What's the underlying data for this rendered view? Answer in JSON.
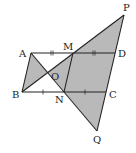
{
  "diagram": {
    "points": {
      "A": {
        "label": "A",
        "x": 31,
        "y": 53
      },
      "M": {
        "label": "M",
        "x": 73,
        "y": 53
      },
      "D": {
        "label": "D",
        "x": 115,
        "y": 53
      },
      "B": {
        "label": "B",
        "x": 22,
        "y": 92
      },
      "N": {
        "label": "N",
        "x": 64,
        "y": 92
      },
      "C": {
        "label": "C",
        "x": 106,
        "y": 92
      },
      "O": {
        "label": "O",
        "x": 48,
        "y": 72
      },
      "P": {
        "label": "P",
        "x": 124,
        "y": 15
      },
      "Q": {
        "label": "Q",
        "x": 97,
        "y": 131
      }
    },
    "labels": {
      "A": "A",
      "M": "M",
      "D": "D",
      "B": "B",
      "N": "N",
      "C": "C",
      "O": "O",
      "P": "P",
      "Q": "Q"
    },
    "shaded_regions": [
      "triangle ABO",
      "triangle OPQ"
    ],
    "shade_color": "#b9b9b9",
    "line_color": "#222222",
    "equal_marks": {
      "double_tick": [
        "AM",
        "MD"
      ],
      "single_tick": [
        "BN",
        "NC"
      ]
    }
  }
}
